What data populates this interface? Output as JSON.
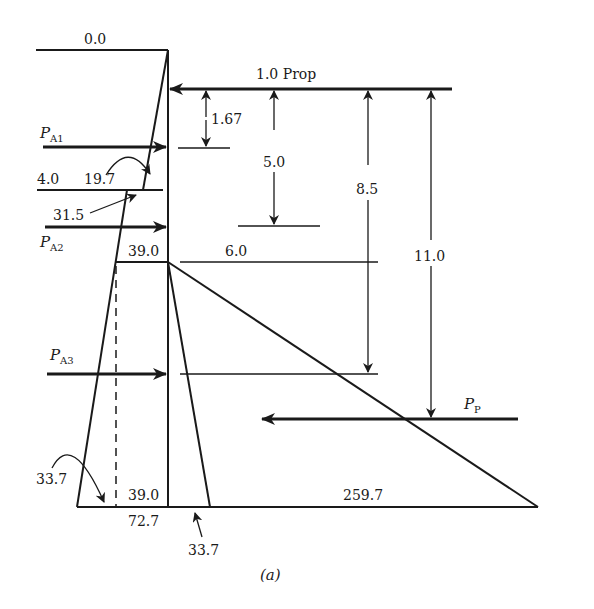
{
  "figure": {
    "caption": "(a)",
    "elevations": {
      "top": "0.0",
      "layer_change": "4.0"
    },
    "prop": {
      "label": "1.0 Prop"
    },
    "forces": {
      "pa1": {
        "main": "P",
        "sub": "A1"
      },
      "pa2": {
        "main": "P",
        "sub": "A2"
      },
      "pa3": {
        "main": "P",
        "sub": "A3"
      },
      "pp": {
        "main": "P",
        "sub": "P"
      }
    },
    "dimensions": {
      "d1": "1.67",
      "d2": "5.0",
      "d3": "8.5",
      "d4": "11.0",
      "d5": "6.0"
    },
    "pressures": {
      "p_4_upper": "19.7",
      "p_4_lower": "31.5",
      "p_dredge_active": "39.0",
      "p_base_active_inner": "39.0",
      "p_base_total": "72.7",
      "p_base_arrow_left": "33.7",
      "p_base_arrow_right": "33.7",
      "p_passive_base": "259.7"
    },
    "colors": {
      "ink": "#1a1a1a",
      "background": "#ffffff"
    }
  }
}
